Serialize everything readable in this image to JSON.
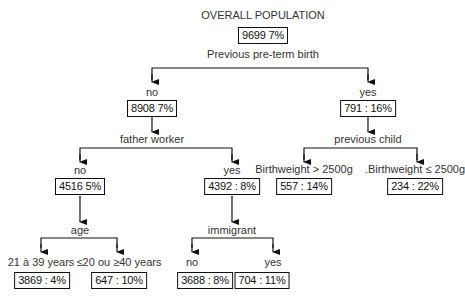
{
  "title": "OVERALL POPULATION",
  "root": {
    "box": "9699   7%",
    "split": "Previous pre-term birth"
  },
  "level1": {
    "no": {
      "branch": "no",
      "box": "8908 7%",
      "split": "father worker"
    },
    "yes": {
      "branch": "yes",
      "box": "791 : 16%",
      "split": "previous child"
    }
  },
  "level2": {
    "father_no": {
      "branch": "no",
      "box": "4516 5%",
      "split": "age"
    },
    "father_yes": {
      "branch": "yes",
      "box": "4392 : 8%",
      "split": "immigrant"
    },
    "bw_gt": {
      "branch": "Birthweight > 2500g",
      "box": "557 : 14%"
    },
    "bw_le": {
      "branch": ".Birthweight ≤ 2500g",
      "box": "234 : 22%"
    }
  },
  "level3": {
    "age_21_39": {
      "branch": "21 à 39 years",
      "box": "3869 : 4%"
    },
    "age_extreme": {
      "branch": "≤20 ou ≥40 years",
      "box": "647 : 10%"
    },
    "immigrant_no": {
      "branch": "no",
      "box": "3688 : 8%"
    },
    "immigrant_yes": {
      "branch": "yes",
      "box": "704 : 11%"
    }
  },
  "colors": {
    "line": "#111111",
    "text": "#333333",
    "background": "#ffffff"
  }
}
